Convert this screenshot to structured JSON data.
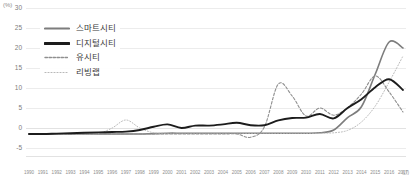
{
  "chart_data": {
    "type": "line",
    "title": "",
    "xlabel": "(년)",
    "ylabel": "(%)",
    "ylim": [
      -5,
      30
    ],
    "yticks": [
      30,
      25,
      20,
      15,
      10,
      5,
      0,
      -5
    ],
    "grid": true,
    "legend_position": "top-left",
    "x": [
      1990,
      1991,
      1992,
      1993,
      1994,
      1995,
      1996,
      1997,
      1998,
      1999,
      2000,
      2001,
      2002,
      2003,
      2004,
      2005,
      2006,
      2007,
      2008,
      2009,
      2010,
      2011,
      2012,
      2013,
      2014,
      2015,
      2016,
      2017
    ],
    "categories": [
      "1990",
      "1991",
      "1992",
      "1993",
      "1994",
      "1995",
      "1996",
      "1997",
      "1998",
      "1999",
      "2000",
      "2001",
      "2002",
      "2003",
      "2004",
      "2005",
      "2006",
      "2007",
      "2008",
      "2009",
      "2010",
      "2011",
      "2012",
      "2013",
      "2014",
      "2015",
      "2016",
      "2017"
    ],
    "series": [
      {
        "name": "스마트시티",
        "color": "#7d7d7d",
        "style": "solid",
        "values": [
          -1.5,
          -1.5,
          -1.5,
          -1.5,
          -1.5,
          -1.5,
          -1.5,
          -1.5,
          -1.5,
          -1.4,
          -1.3,
          -1.3,
          -1.3,
          -1.3,
          -1.3,
          -1.3,
          -1.3,
          -1.3,
          -1.3,
          -1.3,
          -1.3,
          -1.2,
          -0.5,
          2.6,
          5.3,
          13.5,
          21.5,
          20.0
        ]
      },
      {
        "name": "디지털시티",
        "color": "#1c1c1c",
        "style": "solid",
        "values": [
          -1.5,
          -1.5,
          -1.4,
          -1.3,
          -1.2,
          -1.1,
          -1.0,
          -0.9,
          -0.5,
          0.3,
          0.9,
          0.0,
          0.6,
          0.6,
          0.9,
          1.3,
          0.7,
          0.7,
          1.9,
          2.5,
          2.6,
          3.5,
          2.4,
          5.0,
          7.2,
          10.2,
          12.2,
          9.5
        ]
      },
      {
        "name": "유시티",
        "color": "#8f8f8f",
        "style": "dashed",
        "values": [
          -1.5,
          -1.5,
          -1.5,
          -1.5,
          -1.5,
          -1.5,
          -1.5,
          -1.5,
          -1.5,
          -1.5,
          -1.5,
          -1.5,
          -1.5,
          -1.5,
          -1.5,
          -1.5,
          -2.3,
          0.3,
          11.0,
          8.0,
          3.0,
          5.0,
          3.2,
          5.1,
          8.5,
          13.0,
          9.0,
          4.0
        ]
      },
      {
        "name": "리빙랩",
        "color": "#b8b8b8",
        "style": "dotted",
        "values": [
          -1.5,
          -1.5,
          -1.5,
          -1.5,
          -1.5,
          -1.4,
          0.0,
          2.0,
          0.0,
          -1.2,
          -1.3,
          -1.3,
          -1.3,
          -1.3,
          -1.3,
          -1.3,
          -1.3,
          -1.3,
          -1.3,
          -1.3,
          -1.3,
          -1.3,
          -1.2,
          -0.6,
          1.5,
          5.5,
          11.5,
          18.0
        ]
      }
    ]
  },
  "legend": {
    "items": [
      {
        "label": "스마트시티"
      },
      {
        "label": "디지털시티"
      },
      {
        "label": "유시티"
      },
      {
        "label": "리빙랩"
      }
    ]
  }
}
